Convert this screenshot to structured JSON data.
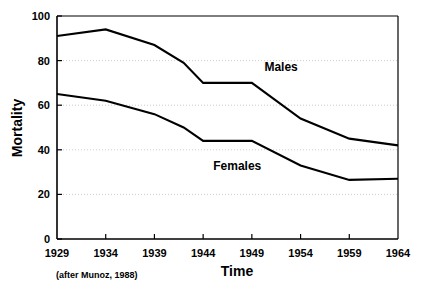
{
  "chart_data": {
    "type": "line",
    "title": "",
    "xlabel": "Time",
    "ylabel": "Mortality",
    "xlim": [
      1929,
      1964
    ],
    "ylim": [
      0,
      100
    ],
    "grid": true,
    "legend_position": "inline-annotations",
    "caption": "(after Munoz, 1988)",
    "x_tick_labels": [
      "1929",
      "1934",
      "1939",
      "1944",
      "1949",
      "1954",
      "1959",
      "1964"
    ],
    "x_ticks": [
      1929,
      1934,
      1939,
      1944,
      1949,
      1954,
      1959,
      1964
    ],
    "y_tick_labels": [
      "0",
      "20",
      "40",
      "60",
      "80",
      "100"
    ],
    "y_ticks": [
      0,
      20,
      40,
      60,
      80,
      100
    ],
    "x": [
      1929,
      1934,
      1939,
      1942,
      1944,
      1949,
      1954,
      1959,
      1964
    ],
    "series": [
      {
        "name": "Males",
        "label": "Males",
        "values": [
          91,
          94,
          87,
          79,
          70,
          70,
          54,
          45,
          42
        ]
      },
      {
        "name": "Females",
        "label": "Females",
        "values": [
          65,
          62,
          56,
          50,
          44,
          44,
          33,
          26.5,
          27
        ]
      }
    ],
    "annotations": [
      {
        "text": "Males",
        "x": 1952.0,
        "y": 75.5
      },
      {
        "text": "Females",
        "x": 1947.5,
        "y": 31.0
      }
    ]
  }
}
